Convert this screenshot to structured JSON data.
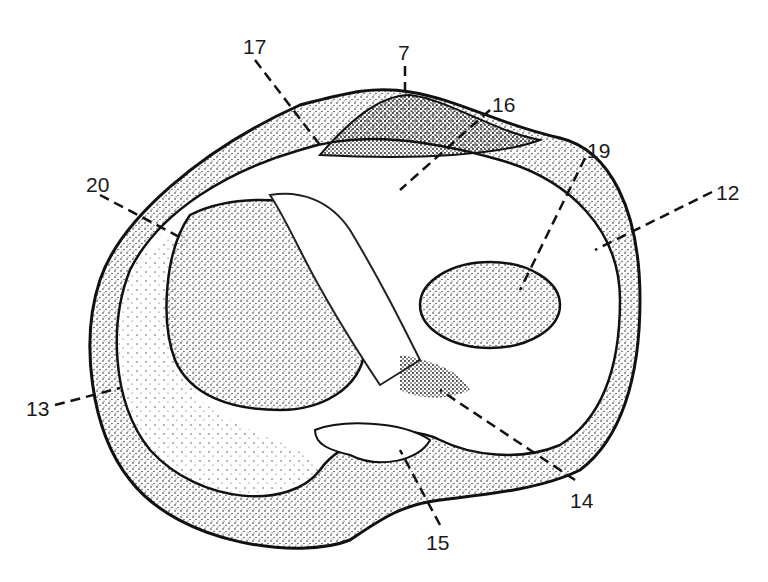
{
  "figure": {
    "type": "anatomical line drawing (stippled)",
    "labels": [
      {
        "id": "l17",
        "text": "17",
        "x": 243,
        "y": 36
      },
      {
        "id": "l7",
        "text": "7",
        "x": 398,
        "y": 42
      },
      {
        "id": "l16",
        "text": "16",
        "x": 492,
        "y": 94
      },
      {
        "id": "l19",
        "text": "19",
        "x": 587,
        "y": 140
      },
      {
        "id": "l12",
        "text": "12",
        "x": 716,
        "y": 182
      },
      {
        "id": "l20",
        "text": "20",
        "x": 86,
        "y": 174
      },
      {
        "id": "l13",
        "text": "13",
        "x": 26,
        "y": 398
      },
      {
        "id": "l14",
        "text": "14",
        "x": 570,
        "y": 490
      },
      {
        "id": "l15",
        "text": "15",
        "x": 426,
        "y": 532
      }
    ]
  }
}
